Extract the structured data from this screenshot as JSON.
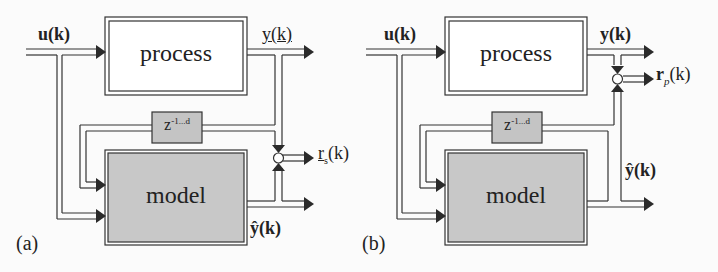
{
  "panels": [
    {
      "id": "a",
      "caption": "(a)",
      "process_label": "process",
      "model_label": "model",
      "delay_label_base": "z",
      "delay_label_sup": "-1...d",
      "input_label": "u(k)",
      "output_label": "y(k)",
      "estimate_label": "ŷ(k)",
      "residual_label": "r",
      "residual_sub": "s",
      "residual_arg": "(k)"
    },
    {
      "id": "b",
      "caption": "(b)",
      "process_label": "process",
      "model_label": "model",
      "delay_label_base": "z",
      "delay_label_sup": "-1...d",
      "input_label": "u(k)",
      "output_label": "y(k)",
      "estimate_label": "ŷ(k)",
      "residual_label": "r",
      "residual_sub": "p",
      "residual_arg": "(k)"
    }
  ],
  "colors": {
    "line": "#333333",
    "model_fill": "#c8c8c8",
    "delay_fill": "#c4c4c4",
    "process_fill": "#ffffff",
    "background": "#fbfbfb"
  }
}
